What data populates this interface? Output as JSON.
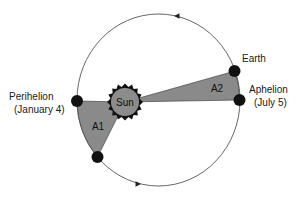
{
  "diagram": {
    "labels": {
      "sun": "Sun",
      "earth": "Earth",
      "aphelion": "Aphelion",
      "aphelion_date": "(July 5)",
      "perihelion": "Perihelion",
      "perihelion_date": "(January 4)",
      "area1": "A1",
      "area2": "A2"
    },
    "colors": {
      "orbit": "#555555",
      "area_fill": "#8a8a8a",
      "sun_fill": "#8c8c8c",
      "planet": "#111111",
      "background": "#ffffff"
    },
    "orbit_direction": "counterclockwise"
  }
}
